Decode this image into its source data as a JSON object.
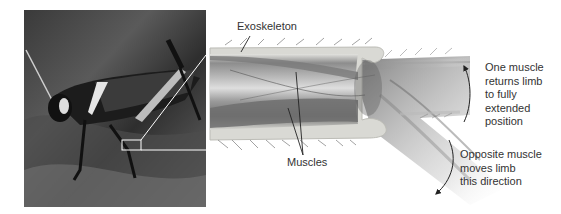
{
  "figure": {
    "photo": {
      "subject": "grasshopper on bark",
      "zoom_box_label": "enlarged region of leg joint"
    },
    "labels": {
      "exoskeleton": "Exoskeleton",
      "muscles": "Muscles",
      "upper_note": [
        "One muscle",
        "returns limb",
        "to fully",
        "extended",
        "position"
      ],
      "lower_note": [
        "Opposite muscle",
        "moves limb",
        "this direction"
      ]
    },
    "colors": {
      "text": "#333333",
      "leader_line": "#222222",
      "callout_line": "#ffffff",
      "exoskeleton_fill": "#d9d9d4",
      "muscle_dark": "#6e6e6e",
      "muscle_light": "#bdbdbd"
    }
  }
}
